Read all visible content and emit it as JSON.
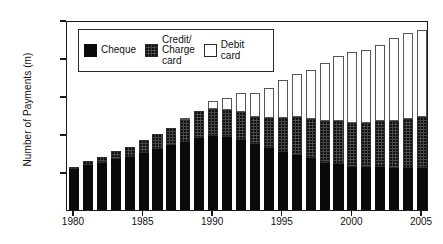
{
  "chart_data": {
    "type": "bar",
    "stacked": true,
    "title": "",
    "xlabel": "",
    "ylabel": "Number of Payments (m)",
    "ylim": [
      0,
      5000
    ],
    "yticks": [
      1000,
      2000,
      3000,
      4000,
      5000
    ],
    "ytick_labels": [
      "1000",
      "2000",
      "3000",
      "4000",
      "5000"
    ],
    "xticks": [
      1980,
      1985,
      1990,
      1995,
      2000,
      2005
    ],
    "xtick_labels": [
      "1980",
      "1985",
      "1990",
      "1995",
      "2000",
      "2005"
    ],
    "grid": false,
    "legend_position": "upper-left-inside",
    "categories": [
      "1980",
      "1981",
      "1982",
      "1983",
      "1984",
      "1985",
      "1986",
      "1987",
      "1988",
      "1989",
      "1990",
      "1991",
      "1992",
      "1993",
      "1994",
      "1995",
      "1996",
      "1997",
      "1998",
      "1999",
      "2000",
      "2001",
      "2002",
      "2003",
      "2004",
      "2005"
    ],
    "series": [
      {
        "name": "Cheque",
        "color": "#0a0a0a",
        "values": [
          1080,
          1180,
          1250,
          1330,
          1400,
          1500,
          1600,
          1700,
          1780,
          1900,
          1950,
          1910,
          1830,
          1740,
          1640,
          1520,
          1440,
          1370,
          1250,
          1200,
          1130,
          1130,
          1130,
          1110,
          1110,
          1110
        ]
      },
      {
        "name": "Credit/\nCharge\ncard",
        "color": "#4a4a4a",
        "values": [
          60,
          110,
          150,
          230,
          250,
          330,
          400,
          470,
          600,
          700,
          720,
          720,
          740,
          710,
          780,
          900,
          1000,
          1020,
          1100,
          1140,
          1170,
          1150,
          1200,
          1240,
          1290,
          1340
        ]
      },
      {
        "name": "Debit\ncard",
        "color": "#ffffff",
        "values": [
          0,
          0,
          0,
          0,
          0,
          0,
          0,
          0,
          20,
          0,
          190,
          330,
          510,
          630,
          780,
          1010,
          1130,
          1300,
          1530,
          1720,
          1870,
          1920,
          2000,
          2170,
          2270,
          2300
        ]
      }
    ],
    "totals": [
      1140,
      1290,
      1400,
      1560,
      1650,
      1830,
      2000,
      2170,
      2400,
      2600,
      2860,
      2960,
      3080,
      3080,
      3200,
      3430,
      3570,
      3690,
      3880,
      4060,
      4170,
      4200,
      4330,
      4520,
      4670,
      4750
    ]
  },
  "legend": {
    "items": [
      {
        "label": "Cheque",
        "swatch": "cheque-swatch"
      },
      {
        "label": "Credit/\nCharge\ncard",
        "swatch": "credit-swatch"
      },
      {
        "label": "Debit\ncard",
        "swatch": "debit-swatch"
      }
    ]
  }
}
